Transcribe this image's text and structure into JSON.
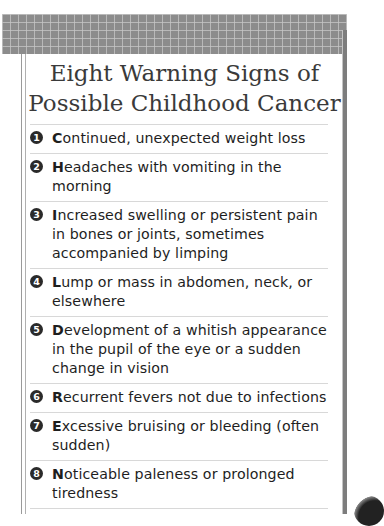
{
  "header": {
    "title_line1": "Eight Warning Signs of",
    "title_line2": "Possible Childhood Cancer"
  },
  "items": [
    {
      "number": "1",
      "initial": "C",
      "rest": "ontinued, unexpected weight loss"
    },
    {
      "number": "2",
      "initial": "H",
      "rest": "eadaches with vomiting in the morning"
    },
    {
      "number": "3",
      "initial": "I",
      "rest": "ncreased swelling or persistent pain in bones or joints, sometimes accompanied by limping"
    },
    {
      "number": "4",
      "initial": "L",
      "rest": "ump or mass in abdomen, neck, or elsewhere"
    },
    {
      "number": "5",
      "initial": "D",
      "rest": "evelopment of a whitish appearance in the pupil of the eye or a sudden change in vision"
    },
    {
      "number": "6",
      "initial": "R",
      "rest": "ecurrent fevers not due to infections"
    },
    {
      "number": "7",
      "initial": "E",
      "rest": "xcessive bruising or bleeding (often sudden)"
    },
    {
      "number": "8",
      "initial": "N",
      "rest": "oticeable paleness or prolonged tiredness"
    }
  ],
  "colors": {
    "band": "#8c8c8c",
    "badge": "#2a2a2a",
    "title": "#3a3a3a",
    "text": "#1e1e1e",
    "divider": "#d8d8d8"
  }
}
